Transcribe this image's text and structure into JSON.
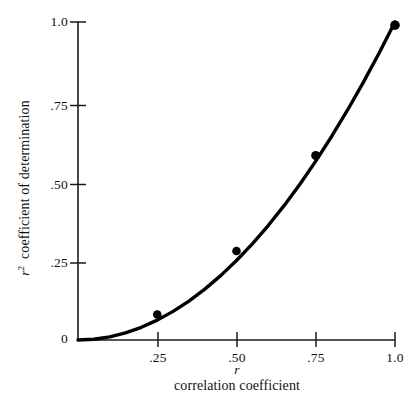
{
  "chart_data": {
    "type": "line",
    "title": "",
    "subtitle": "",
    "xlabel": "correlation coefficient",
    "xlabel_symbol": "r",
    "ylabel": "coefficient of determination",
    "ylabel_symbol": "r",
    "ylabel_symbol_exponent": "2",
    "xlim": [
      0,
      1.0
    ],
    "ylim": [
      0,
      1.0
    ],
    "grid": false,
    "legend": "none",
    "series": [
      {
        "name": "r squared",
        "relation": "y = x^2",
        "x": [
          0,
          0.05,
          0.1,
          0.15,
          0.2,
          0.25,
          0.3,
          0.35,
          0.4,
          0.45,
          0.5,
          0.55,
          0.6,
          0.65,
          0.7,
          0.75,
          0.8,
          0.85,
          0.9,
          0.95,
          1.0
        ],
        "y": [
          0,
          0.0025,
          0.01,
          0.0225,
          0.04,
          0.0625,
          0.09,
          0.1225,
          0.16,
          0.2025,
          0.25,
          0.3025,
          0.36,
          0.4225,
          0.49,
          0.5625,
          0.64,
          0.7225,
          0.81,
          0.9025,
          1.0
        ]
      }
    ],
    "markers": {
      "x": [
        0.25,
        0.5,
        0.75,
        1.0
      ],
      "y": [
        0.08,
        0.28,
        0.58,
        0.99
      ],
      "shape": "filled-circle",
      "color": "#000000"
    },
    "origin_label": "0",
    "x_ticks": [
      {
        "value": 0.25,
        "label": ".25"
      },
      {
        "value": 0.5,
        "label": ".50"
      },
      {
        "value": 0.75,
        "label": ".75"
      },
      {
        "value": 1.0,
        "label": "1.0"
      }
    ],
    "y_ticks": [
      {
        "value": 0.25,
        "label": ".25"
      },
      {
        "value": 0.5,
        "label": ".50"
      },
      {
        "value": 0.75,
        "label": ".75"
      },
      {
        "value": 1.0,
        "label": "1.0"
      }
    ],
    "line_color": "#000000",
    "axis_color": "#1a1a1a",
    "background_color": "#ffffff"
  }
}
